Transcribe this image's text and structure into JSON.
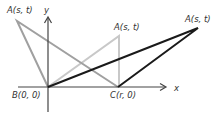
{
  "diagram": {
    "axes": {
      "x_label": "x",
      "y_label": "y"
    },
    "points": {
      "B": {
        "name": "B",
        "coords": "(0, 0)",
        "label": "B(0, 0)"
      },
      "C": {
        "name": "C",
        "coords": "(r, 0)",
        "label": "C(r, 0)"
      },
      "A_left": {
        "name": "A",
        "coords": "(s, t)",
        "label": "A(s, t)"
      },
      "A_middle": {
        "name": "A",
        "coords": "(s, t)",
        "label": "A(s, t)"
      },
      "A_right": {
        "name": "A",
        "coords": "(s, t)",
        "label": "A(s, t)"
      }
    },
    "triangles": [
      {
        "name": "obtuse-left",
        "vertices": [
          "A_left",
          "B",
          "C"
        ],
        "color": "#a0a0a0"
      },
      {
        "name": "right-triangle",
        "vertices": [
          "A_middle",
          "B",
          "C"
        ],
        "color": "#c8c8c8"
      },
      {
        "name": "obtuse-right",
        "vertices": [
          "A_right",
          "B",
          "C"
        ],
        "color": "#1a1a1a"
      }
    ]
  }
}
